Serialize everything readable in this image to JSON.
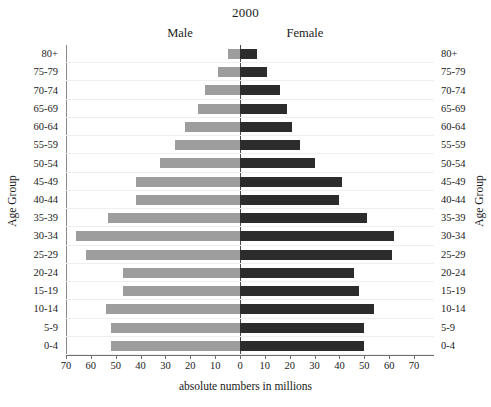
{
  "chart_data": {
    "type": "bar",
    "subtype": "population-pyramid",
    "title": "2000",
    "xlabel": "absolute numbers in millions",
    "ylabel": "Age Group",
    "ylabel_right": "Age Group",
    "grid": true,
    "legend_position": "top-inline",
    "xlim": [
      -70,
      70
    ],
    "xticks_left": [
      70,
      60,
      50,
      40,
      30,
      20,
      10,
      0
    ],
    "xticks_right": [
      10,
      20,
      30,
      40,
      50,
      60,
      70
    ],
    "categories": [
      "80+",
      "75-79",
      "70-74",
      "65-69",
      "60-64",
      "55-59",
      "50-54",
      "45-49",
      "40-44",
      "35-39",
      "30-34",
      "25-29",
      "20-24",
      "15-19",
      "10-14",
      "5-9",
      "0-4"
    ],
    "series": [
      {
        "name": "Male",
        "side": "left",
        "color": "#9d9d9d",
        "values": [
          5,
          9,
          14,
          17,
          22,
          26,
          32,
          42,
          42,
          53,
          66,
          62,
          47,
          47,
          54,
          52,
          52
        ]
      },
      {
        "name": "Female",
        "side": "right",
        "color": "#2c2c2c",
        "values": [
          7,
          11,
          16,
          19,
          21,
          24,
          30,
          41,
          40,
          51,
          62,
          61,
          46,
          48,
          54,
          50,
          50
        ]
      }
    ]
  },
  "colors": {
    "male": "#9d9d9d",
    "female": "#2c2c2c",
    "grid": "#eeeeee",
    "axis": "#6f6f6f",
    "center_axis": "#4a4a4a",
    "text": "#1a1a1a",
    "background": "#ffffff"
  }
}
